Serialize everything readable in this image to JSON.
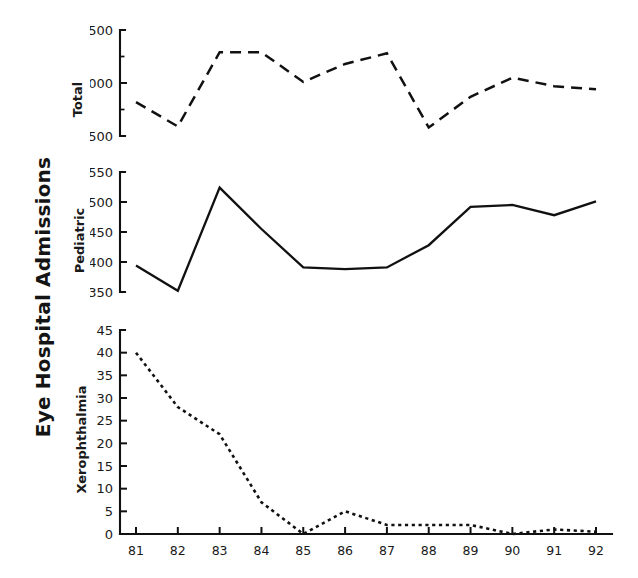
{
  "figure": {
    "y_axis_title": "Eye Hospital Admissions",
    "x_tick_labels": [
      "81",
      "82",
      "83",
      "84",
      "85",
      "86",
      "87",
      "88",
      "89",
      "90",
      "91",
      "92"
    ],
    "ink_color": "#111111",
    "background_color": "#ffffff"
  },
  "panels": [
    {
      "label": "Total",
      "y_tick_labels": [
        "2500",
        "3000",
        "3500"
      ]
    },
    {
      "label": "Pediatric",
      "y_tick_labels": [
        "350",
        "400",
        "450",
        "500",
        "550"
      ]
    },
    {
      "label": "Xerophthalmia",
      "y_tick_labels": [
        "0",
        "5",
        "10",
        "15",
        "20",
        "25",
        "30",
        "35",
        "40",
        "45"
      ]
    }
  ],
  "chart_data": [
    {
      "type": "line",
      "title": "Total",
      "xlabel": "",
      "ylabel": "Total",
      "x": [
        "81",
        "82",
        "83",
        "84",
        "85",
        "86",
        "87",
        "88",
        "89",
        "90",
        "91",
        "92"
      ],
      "values": [
        2820,
        2590,
        3290,
        3290,
        3010,
        3180,
        3280,
        2580,
        2870,
        3050,
        2970,
        2940
      ],
      "ylim": [
        2500,
        3500
      ],
      "yticks": [
        2500,
        3000,
        3500
      ],
      "linestyle": "dashed",
      "grid": false,
      "legend": "none"
    },
    {
      "type": "line",
      "title": "Pediatric",
      "xlabel": "",
      "ylabel": "Pediatric",
      "x": [
        "81",
        "82",
        "83",
        "84",
        "85",
        "86",
        "87",
        "88",
        "89",
        "90",
        "91",
        "92"
      ],
      "values": [
        394,
        352,
        524,
        455,
        391,
        388,
        391,
        428,
        492,
        495,
        478,
        501
      ],
      "ylim": [
        350,
        550
      ],
      "yticks": [
        350,
        400,
        450,
        500,
        550
      ],
      "linestyle": "solid",
      "grid": false,
      "legend": "none"
    },
    {
      "type": "line",
      "title": "Xerophthalmia",
      "xlabel": "",
      "ylabel": "Xerophthalmia",
      "x": [
        "81",
        "82",
        "83",
        "84",
        "85",
        "86",
        "87",
        "88",
        "89",
        "90",
        "91",
        "92"
      ],
      "values": [
        40,
        28,
        22,
        7,
        0,
        5,
        2,
        2,
        2,
        0,
        1,
        0.5
      ],
      "ylim": [
        0,
        45
      ],
      "yticks": [
        0,
        5,
        10,
        15,
        20,
        25,
        30,
        35,
        40,
        45
      ],
      "linestyle": "dotted",
      "grid": false,
      "legend": "none"
    }
  ]
}
